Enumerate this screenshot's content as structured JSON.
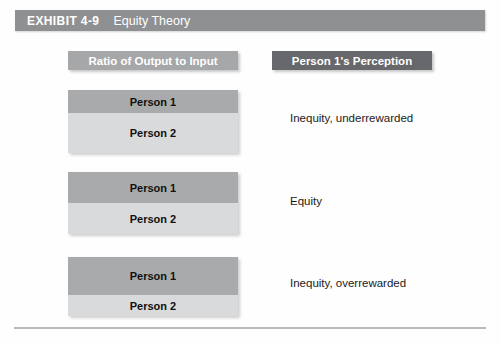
{
  "exhibit": {
    "number": "EXHIBIT 4-9",
    "title": "Equity Theory"
  },
  "columns": {
    "left_header": "Ratio of Output to Input",
    "right_header": "Person 1's Perception"
  },
  "rows": [
    {
      "person1_label": "Person 1",
      "person2_label": "Person 2",
      "perception": "Inequity, underrewarded",
      "person1_height": 23,
      "person2_height": 40
    },
    {
      "person1_label": "Person 1",
      "person2_label": "Person 2",
      "perception": "Equity",
      "person1_height": 31,
      "person2_height": 31
    },
    {
      "person1_label": "Person 1",
      "person2_label": "Person 2",
      "perception": "Inequity, overrewarded",
      "person1_height": 38,
      "person2_height": 21
    }
  ],
  "colors": {
    "exhibit_bar": "#8f9092",
    "left_header_bar": "#a6a7a9",
    "right_header_bar": "#66686b",
    "person1_bar": "#a9aaac",
    "person2_bar": "#d9dadc",
    "rule": "#b9babc"
  },
  "chart_data": {
    "type": "bar",
    "title": "Equity Theory",
    "xlabel": "",
    "ylabel": "Ratio of Output to Input",
    "categories": [
      "Inequity, underrewarded",
      "Equity",
      "Inequity, overrewarded"
    ],
    "series": [
      {
        "name": "Person 1",
        "values": [
          23,
          31,
          38
        ]
      },
      {
        "name": "Person 2",
        "values": [
          40,
          31,
          21
        ]
      }
    ],
    "legend": [
      "Person 1",
      "Person 2"
    ],
    "grid": false,
    "annotations": [
      "Person 1's ratio lower than Person 2's: inequity, underrewarded",
      "Person 1's ratio equal to Person 2's: equity",
      "Person 1's ratio higher than Person 2's: inequity, overrewarded"
    ]
  }
}
